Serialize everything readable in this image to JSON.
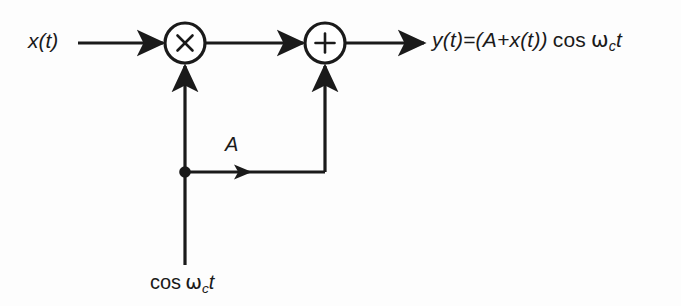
{
  "diagram": {
    "background_color": "#fdfdfd",
    "line_color": "#1a1a1a",
    "labels": {
      "input_signal": "x(t)",
      "gain_branch": "A",
      "carrier": "cos",
      "carrier_omega": "ω",
      "carrier_sub": "c",
      "carrier_t": "t",
      "output_lhs": "y(t)=(A+x(t))",
      "output_cos": "cos",
      "output_omega": "ω",
      "output_sub": "c",
      "output_t": "t"
    },
    "nodes": [
      {
        "name": "multiplier",
        "symbol": "×",
        "cx": 185,
        "cy": 43,
        "r": 20
      },
      {
        "name": "adder",
        "symbol": "+",
        "cx": 325,
        "cy": 43,
        "r": 20
      }
    ],
    "junction": {
      "name": "carrier-split-dot",
      "cx": 185,
      "cy": 172,
      "r": 5.5
    },
    "signals": [
      "x(t) enters the multiplier",
      "carrier cos ωc t enters the multiplier from below",
      "carrier branch labeled A feeds the adder",
      "output y(t)=(A+x(t)) cos ωc t"
    ]
  }
}
